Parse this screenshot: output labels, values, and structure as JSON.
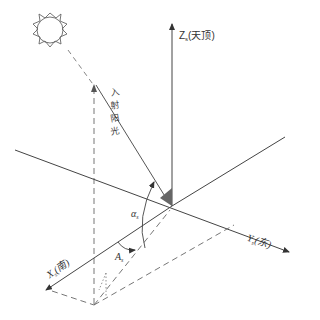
{
  "diagram": {
    "axes": {
      "z": {
        "symbol": "Z",
        "subscript": "s",
        "text": "(天顶)",
        "meaning": "zenith"
      },
      "y": {
        "symbol": "Y",
        "subscript": "s",
        "text": "(东)",
        "meaning": "east"
      },
      "x": {
        "symbol": "X",
        "subscript": "s",
        "text": "(南)",
        "meaning": "south"
      }
    },
    "ray_label": [
      "入",
      "射",
      "阳",
      "光"
    ],
    "angles": {
      "altitude": {
        "symbol": "α",
        "subscript": "s"
      },
      "azimuth": {
        "symbol": "A",
        "subscript": "s"
      }
    },
    "icons": {
      "sun": "sun-icon"
    },
    "colors": {
      "line": "#555555",
      "arrow": "#333333",
      "shade": "#666666"
    }
  }
}
